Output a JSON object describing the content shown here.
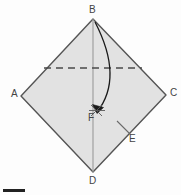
{
  "figure": {
    "background_color": "#fdfdfd",
    "shape": {
      "name": "square-sheet-abcd",
      "fill_color": "#e2e2e2",
      "stroke_color": "#555555",
      "vertices": [
        {
          "label": "B",
          "x": 93,
          "y": 19
        },
        {
          "label": "C",
          "x": 166,
          "y": 95
        },
        {
          "label": "D",
          "x": 93,
          "y": 172
        },
        {
          "label": "A",
          "x": 21,
          "y": 96
        }
      ]
    },
    "crease_line": {
      "name": "dashed-crease-line",
      "style": "dashed",
      "color": "#4a4a4a",
      "x1": 44,
      "y1": 68,
      "x2": 142,
      "y2": 68
    },
    "axis_line": {
      "name": "vertical-axis-line",
      "style": "solid",
      "color": "#8f8f8f",
      "x1": 93,
      "y1": 19,
      "x2": 93,
      "y2": 172
    },
    "fold_arrow": {
      "name": "curved-fold-arrow",
      "color": "#1a1a1a",
      "from": "B",
      "to": "F",
      "start": {
        "x": 95,
        "y": 22
      },
      "control": {
        "x": 124,
        "y": 78
      },
      "end": {
        "x": 97,
        "y": 112
      }
    },
    "point_F": {
      "name": "point-f-cross",
      "x": 97,
      "y": 112,
      "color": "#4a4a4a"
    },
    "leader_line_E": {
      "name": "leader-line-e",
      "color": "#6a6a6a",
      "x1": 117,
      "y1": 121,
      "x2": 130,
      "y2": 134
    },
    "labels": {
      "B": "B",
      "A": "A",
      "C": "C",
      "D": "D",
      "E": "E",
      "F": "F"
    }
  },
  "footer": {
    "rule_name": "footer-rule",
    "color": "#222222"
  }
}
